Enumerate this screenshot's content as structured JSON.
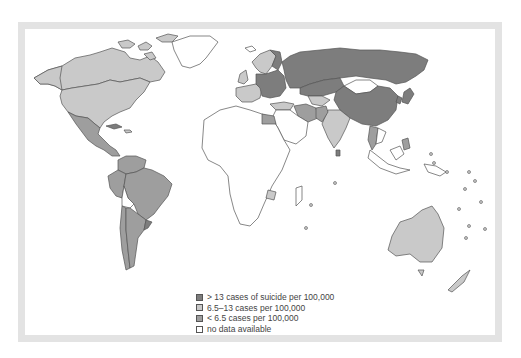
{
  "map": {
    "type": "choropleth",
    "subject": "suicide rates per 100,000",
    "colors": {
      "high": "#7d7d7d",
      "medium": "#c9c9c9",
      "low": "#9e9e9e",
      "no_data": "#ffffff",
      "frame": "#e3e3e3",
      "outline": "#555555"
    },
    "regions": {
      "high": [
        "Russia",
        "Kazakhstan",
        "China",
        "Eastern Europe",
        "Baltic states",
        "Finland",
        "Japan",
        "Sri Lanka",
        "Cuba",
        "Uruguay"
      ],
      "medium": [
        "Canada",
        "United States",
        "Western Europe",
        "Scandinavia",
        "India",
        "Australia",
        "New Zealand",
        "Zimbabwe",
        "Greenland islands",
        "Iran",
        "Turkey"
      ],
      "low": [
        "Mexico",
        "Central America",
        "Brazil",
        "Argentina",
        "Peru",
        "Colombia",
        "Venezuela",
        "Chile",
        "Egypt",
        "Thailand",
        "Philippines",
        "Pakistan"
      ],
      "no_data": [
        "Africa (most)",
        "Middle East",
        "Mongolia",
        "Indonesia",
        "Greenland",
        "Bolivia",
        "Papua New Guinea"
      ]
    }
  },
  "legend": {
    "items": [
      {
        "label": "> 13 cases of suicide per 100,000",
        "key": "high"
      },
      {
        "label": "6.5–13 cases per 100,000",
        "key": "medium"
      },
      {
        "label": "< 6.5 cases per 100,000",
        "key": "low"
      },
      {
        "label": "no data available",
        "key": "no_data"
      }
    ]
  }
}
